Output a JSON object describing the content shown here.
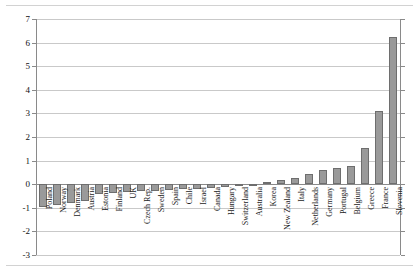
{
  "chart_data": {
    "type": "bar",
    "title": "",
    "subtitle": "",
    "xlabel": "",
    "ylabel": "",
    "ylim": [
      -3,
      7
    ],
    "ytick_step": 1,
    "yticks": [
      7,
      6,
      5,
      4,
      3,
      2,
      1,
      0,
      -1,
      -2,
      -3
    ],
    "ytick_labels": [
      "7",
      "6",
      "5",
      "4",
      "3",
      "2",
      "1",
      "0",
      "-1",
      "-2",
      "-3"
    ],
    "grid": true,
    "grid_axis": "y",
    "legend": false,
    "legend_position": "none",
    "sorted": "ascending",
    "bar_color": "#9a9a9a",
    "bar_edge_color": "#6e6e6e",
    "gridline_color": "#c9c9c9",
    "axis_color": "#8a8a8a",
    "categories": [
      "Poland",
      "Norway",
      "Denmark",
      "Austria",
      "Estonia",
      "Finland",
      "UK",
      "Czech Rep.",
      "Sweden",
      "Spain",
      "Chile",
      "Israel",
      "Canada",
      "Hungary",
      "Switzerland",
      "Australia",
      "Korea",
      "New Zealand",
      "Italy",
      "Netherlands",
      "Germany",
      "Portugal",
      "Belgium",
      "Greece",
      "France",
      "Slovenia"
    ],
    "values": [
      -0.95,
      -0.9,
      -0.8,
      -0.7,
      -0.4,
      -0.38,
      -0.35,
      -0.3,
      -0.28,
      -0.25,
      -0.22,
      -0.2,
      -0.18,
      -0.12,
      -0.06,
      -0.04,
      0.1,
      0.18,
      0.28,
      0.42,
      0.62,
      0.68,
      0.78,
      1.52,
      3.1,
      6.22
    ]
  },
  "frame": {
    "top_rule": "",
    "bottom_rule": ""
  }
}
